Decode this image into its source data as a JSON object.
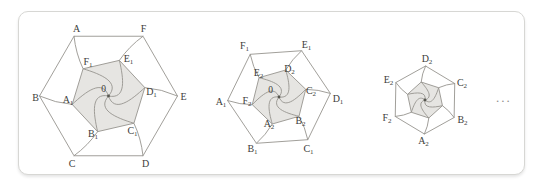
{
  "page": {
    "background": "#ffffff"
  },
  "card": {
    "x": 18,
    "y": 11,
    "width": 507,
    "height": 164,
    "radius": 10,
    "border_color": "#d7d7d4",
    "background": "#ffffff"
  },
  "style": {
    "line_color": "#96948e",
    "fill_color": "#e6e5e2",
    "label_color": "#3d3d3b",
    "dot_color": "#56564f",
    "ellipsis_color": "#8f8f8b"
  },
  "ellipsis": {
    "text": "..."
  },
  "figures": [
    {
      "name": "hexagon-iteration-1",
      "center": {
        "x": 108.5,
        "y": 96
      },
      "outer_radius": 69,
      "outer_rotation_deg": 0,
      "inner_ratio": 0.54,
      "inner_rotation_offset_deg": 13,
      "center_label": {
        "base": "0",
        "sub": "",
        "x": 103.5,
        "y": 91.5
      },
      "outer_labels": [
        {
          "base": "E",
          "sub": "",
          "x": 183.5,
          "y": 99.5
        },
        {
          "base": "F",
          "sub": "",
          "x": 143.5,
          "y": 31.5
        },
        {
          "base": "A",
          "sub": "",
          "x": 76.5,
          "y": 31.5
        },
        {
          "base": "B",
          "sub": "",
          "x": 35.5,
          "y": 100.5
        },
        {
          "base": "C",
          "sub": "",
          "x": 72,
          "y": 166.5
        },
        {
          "base": "D",
          "sub": "",
          "x": 145.5,
          "y": 166.5
        }
      ],
      "inner_labels": [
        {
          "base": "D",
          "sub": "1",
          "x": 151.5,
          "y": 94.5
        },
        {
          "base": "E",
          "sub": "1",
          "x": 128.5,
          "y": 62
        },
        {
          "base": "F",
          "sub": "1",
          "x": 88,
          "y": 65
        },
        {
          "base": "A",
          "sub": "1",
          "x": 68,
          "y": 103
        },
        {
          "base": "B",
          "sub": "1",
          "x": 93,
          "y": 136.5
        },
        {
          "base": "C",
          "sub": "1",
          "x": 132.5,
          "y": 134
        }
      ]
    },
    {
      "name": "hexagon-iteration-2",
      "center": {
        "x": 279,
        "y": 97
      },
      "outer_radius": 51.5,
      "outer_rotation_deg": 4,
      "inner_ratio": 0.54,
      "inner_rotation_offset_deg": 12,
      "center_label": {
        "base": "0",
        "sub": "",
        "x": 270.5,
        "y": 92.5
      },
      "outer_labels": [
        {
          "base": "D",
          "sub": "1",
          "x": 338,
          "y": 102
        },
        {
          "base": "E",
          "sub": "1",
          "x": 306.5,
          "y": 47.5
        },
        {
          "base": "F",
          "sub": "1",
          "x": 244.5,
          "y": 48.5
        },
        {
          "base": "A",
          "sub": "1",
          "x": 221,
          "y": 104.5
        },
        {
          "base": "B",
          "sub": "1",
          "x": 252.5,
          "y": 152
        },
        {
          "base": "C",
          "sub": "1",
          "x": 308.5,
          "y": 152
        }
      ],
      "inner_labels": [
        {
          "base": "C",
          "sub": "2",
          "x": 311,
          "y": 94
        },
        {
          "base": "D",
          "sub": "2",
          "x": 289.5,
          "y": 71.5
        },
        {
          "base": "E",
          "sub": "2",
          "x": 258.5,
          "y": 75.5
        },
        {
          "base": "F",
          "sub": "2",
          "x": 247,
          "y": 104
        },
        {
          "base": "A",
          "sub": "2",
          "x": 269,
          "y": 127
        },
        {
          "base": "B",
          "sub": "2",
          "x": 300.5,
          "y": 124
        }
      ]
    },
    {
      "name": "hexagon-iteration-3",
      "center": {
        "x": 425,
        "y": 100
      },
      "outer_radius": 34,
      "outer_rotation_deg": 29,
      "inner_ratio": 0.54,
      "inner_rotation_offset_deg": 13,
      "center_label": null,
      "outer_labels": [
        {
          "base": "C",
          "sub": "2",
          "x": 462,
          "y": 85.5
        },
        {
          "base": "D",
          "sub": "2",
          "x": 427,
          "y": 62
        },
        {
          "base": "E",
          "sub": "2",
          "x": 388.5,
          "y": 83
        },
        {
          "base": "F",
          "sub": "2",
          "x": 387,
          "y": 121
        },
        {
          "base": "A",
          "sub": "2",
          "x": 423.5,
          "y": 143.5
        },
        {
          "base": "B",
          "sub": "2",
          "x": 462.5,
          "y": 123
        }
      ],
      "inner_labels": []
    }
  ]
}
